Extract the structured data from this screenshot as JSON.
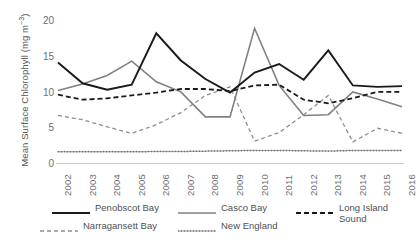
{
  "chart_data": {
    "type": "line",
    "title": "",
    "xlabel": "",
    "ylabel": "Mean Surface Chlorophyll (mg m−3)",
    "ylabel_main": "Mean Surface Chlorophyll (mg m",
    "ylabel_exp": "−3",
    "ylabel_close": ")",
    "categories": [
      "2002",
      "2003",
      "2004",
      "2005",
      "2006",
      "2007",
      "2008",
      "2009",
      "2010",
      "2011",
      "2012",
      "2013",
      "2014",
      "2015",
      "2016"
    ],
    "x": [
      2002,
      2003,
      2004,
      2005,
      2006,
      2007,
      2008,
      2009,
      2010,
      2011,
      2012,
      2013,
      2014,
      2015,
      2016
    ],
    "ylim": [
      0,
      21
    ],
    "yticks": [
      0,
      5,
      10,
      15,
      20
    ],
    "ytick_labels": [
      "0",
      "5",
      "10",
      "15",
      "20"
    ],
    "grid": false,
    "legend_position": "bottom",
    "series": [
      {
        "name": "Penobscot Bay",
        "style": "solid",
        "color": "#1a1a1a",
        "width": 1.9,
        "values": [
          14.2,
          11.3,
          10.4,
          11.1,
          18.3,
          14.5,
          11.9,
          10.0,
          12.8,
          14.0,
          11.8,
          15.9,
          11.0,
          10.8,
          10.9
        ]
      },
      {
        "name": "Casco Bay",
        "style": "solid",
        "color": "#7f8082",
        "width": 1.6,
        "values": [
          10.3,
          11.2,
          12.4,
          14.4,
          11.5,
          10.1,
          6.6,
          6.6,
          19.0,
          11.0,
          6.8,
          6.9,
          10.1,
          9.1,
          8.0
        ]
      },
      {
        "name": "Long Island Sound",
        "style": "dashed",
        "color": "#1a1a1a",
        "width": 1.8,
        "values": [
          9.7,
          9.0,
          9.2,
          9.6,
          10.0,
          10.5,
          10.5,
          10.2,
          11.0,
          11.1,
          9.0,
          8.5,
          9.2,
          10.1,
          10.1
        ]
      },
      {
        "name": "Narragansett Bay",
        "style": "dashed",
        "color": "#8d8e90",
        "width": 1.3,
        "values": [
          6.8,
          6.2,
          5.2,
          4.3,
          5.5,
          7.2,
          9.6,
          10.8,
          3.2,
          4.4,
          6.9,
          9.6,
          3.1,
          5.0,
          4.3
        ]
      },
      {
        "name": "New England",
        "style": "dotted",
        "color": "#6d6e70",
        "width": 1.5,
        "values": [
          1.7,
          1.7,
          1.7,
          1.7,
          1.75,
          1.75,
          1.8,
          1.85,
          1.9,
          1.9,
          1.85,
          1.8,
          1.9,
          1.9,
          1.9
        ]
      }
    ],
    "legend": [
      {
        "label": "Penobscot Bay",
        "style": "solid",
        "color": "#1a1a1a",
        "width": 1.9
      },
      {
        "label": "Casco Bay",
        "style": "solid",
        "color": "#7f8082",
        "width": 1.6
      },
      {
        "label": "Long Island\nSound",
        "style": "dashed",
        "color": "#1a1a1a",
        "width": 1.8
      },
      {
        "label": "Narragansett Bay",
        "style": "dashed",
        "color": "#8d8e90",
        "width": 1.3
      },
      {
        "label": "New England",
        "style": "dotted",
        "color": "#6d6e70",
        "width": 1.5
      }
    ],
    "axis_color": "#9a9b9d"
  }
}
